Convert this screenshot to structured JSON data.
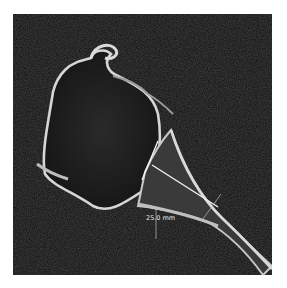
{
  "image": {
    "type": "CT scan",
    "background_color": "#0d0d0d",
    "structure_color": "#cfcfcf",
    "measurement_color": "#f2f2f2"
  },
  "measurement": {
    "label": "25.0 mm",
    "value": 25.0,
    "unit": "mm"
  }
}
